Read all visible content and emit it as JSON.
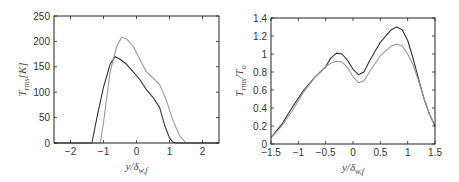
{
  "chart_data": [
    {
      "type": "line",
      "title": "",
      "xlabel": "y/δ_{w,f}",
      "ylabel": "T_rms [K]",
      "xlim": [
        -2.5,
        2.5
      ],
      "ylim": [
        0,
        250
      ],
      "xticks": [
        "-2",
        "-1",
        "0",
        "1",
        "2"
      ],
      "yticks": [
        "0",
        "50",
        "100",
        "150",
        "200",
        "250"
      ],
      "grid": false,
      "series": [
        {
          "name": "dark",
          "color": "#333333",
          "x": [
            -2.5,
            -1.35,
            -1.2,
            -1.0,
            -0.8,
            -0.65,
            -0.5,
            -0.3,
            -0.1,
            0.1,
            0.3,
            0.5,
            0.7,
            0.85,
            1.0,
            1.1,
            1.2,
            2.5
          ],
          "y": [
            0,
            0,
            50,
            110,
            155,
            170,
            165,
            155,
            140,
            125,
            105,
            90,
            70,
            35,
            10,
            2,
            0,
            0
          ]
        },
        {
          "name": "light",
          "color": "#999999",
          "x": [
            -2.5,
            -1.1,
            -1.0,
            -0.8,
            -0.6,
            -0.45,
            -0.3,
            -0.1,
            0.1,
            0.3,
            0.5,
            0.7,
            0.9,
            1.1,
            1.3,
            1.5,
            2.5
          ],
          "y": [
            0,
            0,
            40,
            140,
            190,
            208,
            205,
            190,
            165,
            140,
            128,
            115,
            85,
            45,
            15,
            0,
            0
          ]
        }
      ]
    },
    {
      "type": "line",
      "title": "",
      "xlabel": "y/δ_{w,f}",
      "ylabel": "T_rms/T_o",
      "xlim": [
        -1.5,
        1.5
      ],
      "ylim": [
        0,
        1.4
      ],
      "xticks": [
        "-1.5",
        "-1",
        "-0.5",
        "0",
        "0.5",
        "1",
        "1.5"
      ],
      "yticks": [
        "0",
        "0.2",
        "0.4",
        "0.6",
        "0.8",
        "1",
        "1.2",
        "1.4"
      ],
      "grid": false,
      "series": [
        {
          "name": "dark",
          "color": "#333333",
          "x": [
            -1.5,
            -1.3,
            -1.1,
            -0.9,
            -0.7,
            -0.5,
            -0.4,
            -0.3,
            -0.2,
            -0.1,
            0.0,
            0.1,
            0.2,
            0.3,
            0.5,
            0.7,
            0.8,
            0.9,
            1.0,
            1.1,
            1.2,
            1.3,
            1.4,
            1.5
          ],
          "y": [
            0.07,
            0.22,
            0.42,
            0.6,
            0.74,
            0.86,
            0.96,
            1.01,
            1.0,
            0.93,
            0.83,
            0.77,
            0.8,
            0.92,
            1.13,
            1.27,
            1.3,
            1.27,
            1.15,
            0.95,
            0.72,
            0.5,
            0.33,
            0.2
          ]
        },
        {
          "name": "light",
          "color": "#999999",
          "x": [
            -1.5,
            -1.3,
            -1.1,
            -0.9,
            -0.7,
            -0.5,
            -0.4,
            -0.3,
            -0.2,
            -0.1,
            0.0,
            0.1,
            0.2,
            0.3,
            0.5,
            0.7,
            0.8,
            0.9,
            1.0,
            1.1,
            1.2,
            1.3,
            1.4,
            1.5
          ],
          "y": [
            0.07,
            0.2,
            0.38,
            0.58,
            0.74,
            0.86,
            0.9,
            0.92,
            0.91,
            0.85,
            0.75,
            0.68,
            0.7,
            0.8,
            0.98,
            1.09,
            1.11,
            1.09,
            1.0,
            0.88,
            0.7,
            0.5,
            0.33,
            0.2
          ]
        }
      ]
    }
  ]
}
